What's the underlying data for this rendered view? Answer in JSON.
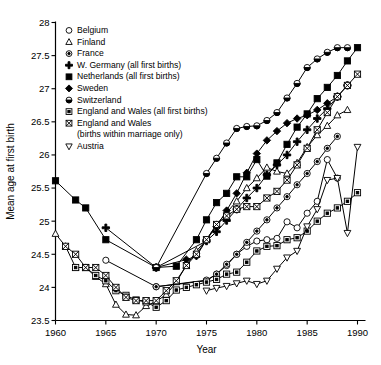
{
  "chart_data": {
    "type": "line",
    "title": "",
    "xlabel": "Year",
    "ylabel": "Mean age at first birth",
    "xlim": [
      1960,
      1990
    ],
    "ylim": [
      23.5,
      28
    ],
    "xticks": [
      "1960",
      "1965",
      "1970",
      "1975",
      "1980",
      "1985",
      "1990"
    ],
    "yticks": [
      "23.5",
      "24",
      "24.5",
      "25",
      "25.5",
      "26",
      "26.5",
      "27",
      "27.5",
      "28"
    ],
    "grid": false,
    "legend_position": "upper-left",
    "series": [
      {
        "name": "Belgium",
        "marker": "circle-open",
        "x": [
          1965,
          1970,
          1975,
          1976,
          1977,
          1978,
          1979,
          1980,
          1981,
          1982,
          1983,
          1984,
          1985,
          1986,
          1987,
          1988
        ],
        "values": [
          24.41,
          24.01,
          24.1,
          24.2,
          24.33,
          24.5,
          24.62,
          24.7,
          24.72,
          24.74,
          24.99,
          24.9,
          25.12,
          25.3,
          25.93,
          25.65
        ]
      },
      {
        "name": "Finland",
        "marker": "triangle-up-open",
        "x": [
          1960,
          1961,
          1962,
          1963,
          1964,
          1965,
          1966,
          1967,
          1968,
          1969,
          1970,
          1971,
          1972,
          1973,
          1974,
          1975,
          1976,
          1977,
          1978,
          1979,
          1980,
          1981,
          1982,
          1983,
          1984,
          1985,
          1986,
          1987,
          1988,
          1989
        ],
        "values": [
          24.81,
          24.62,
          24.3,
          24.3,
          24.16,
          24.05,
          23.74,
          23.59,
          23.58,
          23.72,
          23.79,
          23.89,
          24.08,
          24.33,
          24.55,
          24.72,
          24.95,
          25.13,
          25.3,
          25.5,
          25.65,
          25.81,
          25.75,
          25.72,
          25.88,
          26.12,
          26.3,
          26.44,
          26.6,
          26.68
        ]
      },
      {
        "name": "France",
        "marker": "circle-dot",
        "x": [
          1970,
          1975,
          1976,
          1977,
          1978,
          1979,
          1980,
          1981,
          1982,
          1983,
          1984,
          1985,
          1986,
          1987,
          1988
        ],
        "values": [
          24.01,
          24.11,
          24.2,
          24.35,
          24.5,
          24.68,
          24.85,
          25.02,
          25.2,
          25.37,
          25.55,
          25.72,
          25.9,
          26.1,
          26.28
        ]
      },
      {
        "name": "W. Germany (all first births)",
        "marker": "plus-fill",
        "x": [
          1965,
          1970,
          1975,
          1976,
          1977,
          1978,
          1979,
          1980,
          1981,
          1982,
          1983,
          1984,
          1985,
          1986,
          1987,
          1988,
          1989
        ],
        "values": [
          24.9,
          24.3,
          24.7,
          24.84,
          25.01,
          25.18,
          25.35,
          25.5,
          25.7,
          25.85,
          26.0,
          26.2,
          26.38,
          26.55,
          26.7,
          26.88,
          27.05
        ]
      },
      {
        "name": "Netherlands (all first births)",
        "marker": "square-fill",
        "x": [
          1960,
          1962,
          1963,
          1965,
          1970,
          1972,
          1974,
          1975,
          1976,
          1977,
          1978,
          1979,
          1980,
          1981,
          1982,
          1983,
          1984,
          1985,
          1986,
          1987,
          1988,
          1989,
          1990
        ],
        "values": [
          25.61,
          25.32,
          25.2,
          24.72,
          24.3,
          24.32,
          24.72,
          25.02,
          25.28,
          25.42,
          25.67,
          25.67,
          25.93,
          25.68,
          25.88,
          26.16,
          26.42,
          26.62,
          26.85,
          27.02,
          27.2,
          27.42,
          27.62
        ]
      },
      {
        "name": "Sweden",
        "marker": "diamond-fill",
        "x": [
          1970,
          1973,
          1974,
          1975,
          1976,
          1977,
          1978,
          1979,
          1980,
          1981,
          1982,
          1983,
          1984,
          1985,
          1986,
          1987,
          1988
        ],
        "values": [
          24.3,
          24.42,
          24.47,
          24.72,
          24.92,
          25.16,
          25.42,
          25.73,
          26.02,
          26.22,
          26.36,
          26.48,
          26.55,
          26.6,
          26.68,
          26.78,
          26.88
        ]
      },
      {
        "name": "Switzerland",
        "marker": "circle-half",
        "x": [
          1970,
          1975,
          1976,
          1977,
          1978,
          1979,
          1980,
          1981,
          1982,
          1983,
          1984,
          1985,
          1986,
          1987,
          1988,
          1989
        ],
        "values": [
          24.3,
          25.72,
          25.95,
          26.18,
          26.4,
          26.43,
          26.44,
          26.52,
          26.64,
          26.86,
          27.08,
          27.32,
          27.45,
          27.55,
          27.62,
          27.62
        ]
      },
      {
        "name": "England and Wales (all first births)",
        "marker": "square-dot",
        "x": [
          1962,
          1963,
          1964,
          1965,
          1966,
          1967,
          1968,
          1969,
          1970,
          1971,
          1972,
          1973,
          1974,
          1975,
          1976,
          1977,
          1978,
          1979,
          1980,
          1981,
          1982,
          1983,
          1984,
          1985,
          1986,
          1987,
          1988,
          1989,
          1990
        ],
        "values": [
          24.3,
          24.3,
          24.18,
          24.1,
          23.95,
          23.88,
          23.81,
          23.78,
          23.7,
          23.8,
          23.96,
          24.0,
          24.04,
          24.08,
          24.12,
          24.2,
          24.23,
          24.38,
          24.55,
          24.62,
          24.63,
          24.72,
          24.75,
          24.85,
          25.0,
          25.12,
          25.2,
          25.3,
          25.43
        ]
      },
      {
        "name": "England and Wales (births within marriage only)",
        "marker": "square-cross",
        "x": [
          1961,
          1962,
          1963,
          1964,
          1965,
          1966,
          1967,
          1968,
          1969,
          1970,
          1971,
          1972,
          1973,
          1974,
          1975,
          1976,
          1977,
          1978,
          1979,
          1980,
          1981,
          1982,
          1983,
          1984,
          1985,
          1986,
          1987,
          1988,
          1989,
          1990
        ],
        "values": [
          24.62,
          24.5,
          24.3,
          24.3,
          24.18,
          24.0,
          23.85,
          23.8,
          23.8,
          23.8,
          23.95,
          24.1,
          24.33,
          24.5,
          24.72,
          24.95,
          25.08,
          25.18,
          25.22,
          25.22,
          25.35,
          25.45,
          25.62,
          25.85,
          26.1,
          26.38,
          26.64,
          26.88,
          27.05,
          27.22
        ]
      },
      {
        "name": "Austria",
        "marker": "triangle-down-open",
        "x": [
          1975,
          1976,
          1977,
          1978,
          1979,
          1980,
          1981,
          1982,
          1983,
          1984,
          1985,
          1986,
          1987,
          1988,
          1989,
          1990
        ],
        "values": [
          23.95,
          23.99,
          24.02,
          24.06,
          24.1,
          24.05,
          24.1,
          24.28,
          24.45,
          24.55,
          24.92,
          25.18,
          25.62,
          25.65,
          24.82,
          26.12
        ]
      }
    ]
  },
  "legend": {
    "items": [
      {
        "label": "Belgium",
        "marker": "circle-open"
      },
      {
        "label": "Finland",
        "marker": "triangle-up-open"
      },
      {
        "label": "France",
        "marker": "circle-dot"
      },
      {
        "label": "W. Germany (all first births)",
        "marker": "plus-fill"
      },
      {
        "label": "Netherlands (all first births)",
        "marker": "square-fill"
      },
      {
        "label": "Sweden",
        "marker": "diamond-fill"
      },
      {
        "label": "Switzerland",
        "marker": "circle-half"
      },
      {
        "label": "England and Wales (all first births)",
        "marker": "square-dot"
      },
      {
        "label": "England and Wales",
        "marker": "square-cross"
      },
      {
        "label": "(births within marriage only)",
        "marker": "none"
      },
      {
        "label": "Austria",
        "marker": "triangle-down-open"
      }
    ]
  }
}
